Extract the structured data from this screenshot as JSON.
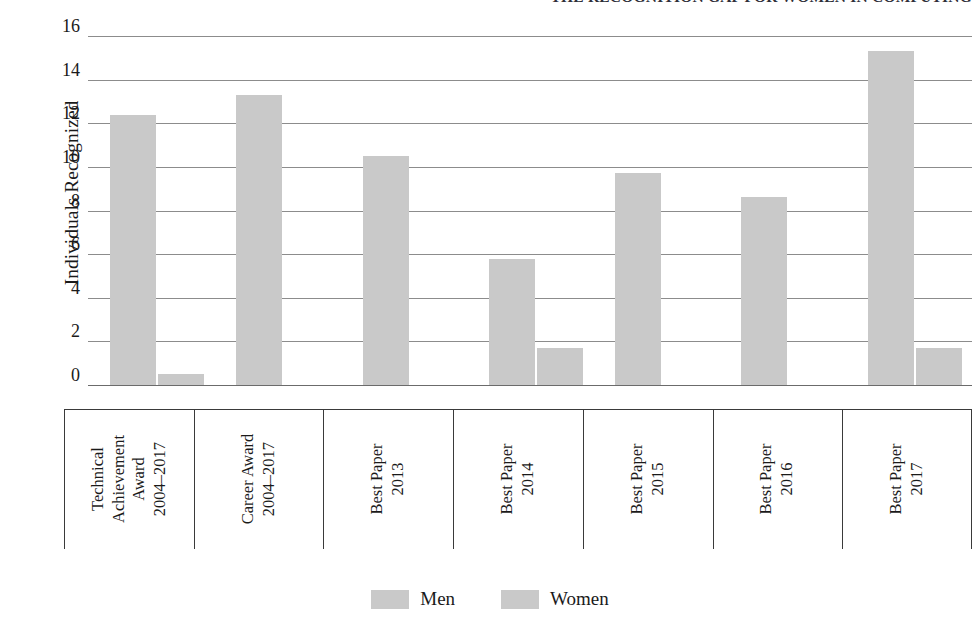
{
  "figure": {
    "clipped_title": "THE RECOGNITION GAP FOR WOMEN IN COMPUTING"
  },
  "legend": {
    "position": "bottom-center",
    "items": [
      {
        "label": "Men",
        "color": "#c9c9c9",
        "swatch_name": "men-swatch"
      },
      {
        "label": "Women",
        "color": "#c9c9c9",
        "swatch_name": "women-swatch"
      }
    ]
  },
  "chart_data": {
    "type": "bar",
    "title": "THE RECOGNITION GAP FOR WOMEN IN COMPUTING",
    "xlabel": "",
    "ylabel": "Individuals Recognized",
    "ylim": [
      0,
      16
    ],
    "yticks": [
      0,
      2,
      4,
      6,
      8,
      10,
      12,
      14,
      16
    ],
    "ytick_labels": [
      "0",
      "2",
      "4",
      "6",
      "8",
      "10",
      "12",
      "14",
      "16"
    ],
    "grid": true,
    "grid_axis": "y",
    "legend_position": "bottom-center",
    "bar_color": "#c9c9c9",
    "categories": [
      "Technical Achievement Award 2004–2017",
      "Career Award 2004–2017",
      "Best Paper 2013",
      "Best Paper 2014",
      "Best Paper 2015",
      "Best Paper 2016",
      "Best Paper 2017"
    ],
    "category_lines": [
      [
        "Technical",
        "Achievement",
        "Award",
        "2004–2017"
      ],
      [
        "Career Award",
        "2004–2017"
      ],
      [
        "Best Paper",
        "2013"
      ],
      [
        "Best Paper",
        "2014"
      ],
      [
        "Best Paper",
        "2015"
      ],
      [
        "Best Paper",
        "2016"
      ],
      [
        "Best Paper",
        "2017"
      ]
    ],
    "series": [
      {
        "name": "Men",
        "color": "#c9c9c9",
        "values": [
          12.4,
          13.3,
          10.5,
          5.8,
          9.7,
          8.6,
          15.3
        ]
      },
      {
        "name": "Women",
        "color": "#c9c9c9",
        "values": [
          0.5,
          0,
          0,
          1.7,
          0,
          0,
          1.7
        ]
      }
    ]
  }
}
